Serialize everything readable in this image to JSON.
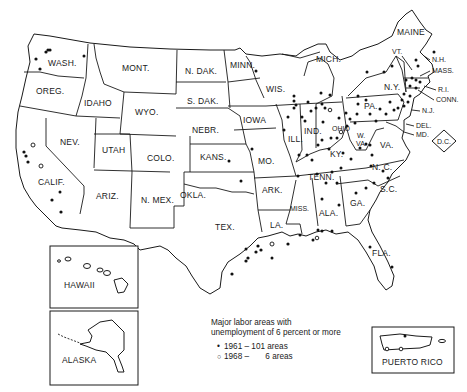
{
  "map": {
    "title": "Major labor areas with unemployment of 6 percent or more",
    "states": [
      {
        "id": "wa",
        "label": "WASH.",
        "x": 48,
        "y": 64
      },
      {
        "id": "or",
        "label": "OREG.",
        "x": 37,
        "y": 92
      },
      {
        "id": "id",
        "label": "IDAHO",
        "x": 84,
        "y": 104
      },
      {
        "id": "mt",
        "label": "MONT.",
        "x": 122,
        "y": 69
      },
      {
        "id": "wy",
        "label": "WYO.",
        "x": 136,
        "y": 113
      },
      {
        "id": "nd",
        "label": "N. DAK.",
        "x": 185,
        "y": 72
      },
      {
        "id": "sd",
        "label": "S. DAK.",
        "x": 187,
        "y": 102
      },
      {
        "id": "ne",
        "label": "NEBR.",
        "x": 192,
        "y": 131
      },
      {
        "id": "mn",
        "label": "MINN.",
        "x": 232,
        "y": 66
      },
      {
        "id": "ia",
        "label": "IOWA",
        "x": 244,
        "y": 121
      },
      {
        "id": "wi",
        "label": "WIS.",
        "x": 265,
        "y": 92
      },
      {
        "id": "mi",
        "label": "MICH.",
        "x": 318,
        "y": 62
      },
      {
        "id": "nv",
        "label": "NEV.",
        "x": 61,
        "y": 143
      },
      {
        "id": "ut",
        "label": "UTAH",
        "x": 103,
        "y": 151
      },
      {
        "id": "co",
        "label": "COLO.",
        "x": 147,
        "y": 159
      },
      {
        "id": "ks",
        "label": "KANS.",
        "x": 201,
        "y": 158
      },
      {
        "id": "mo",
        "label": "MO.",
        "x": 259,
        "y": 162
      },
      {
        "id": "il",
        "label": "ILL.",
        "x": 291,
        "y": 140
      },
      {
        "id": "in",
        "label": "IND.",
        "x": 316,
        "y": 132
      },
      {
        "id": "oh",
        "label": "OHIO",
        "x": 336,
        "y": 130
      },
      {
        "id": "ky",
        "label": "KY.",
        "x": 333,
        "y": 155
      },
      {
        "id": "wv",
        "label": "W.\nVA.",
        "x": 360,
        "y": 140
      },
      {
        "id": "va",
        "label": "VA.",
        "x": 382,
        "y": 146
      },
      {
        "id": "pa",
        "label": "PA.",
        "x": 366,
        "y": 107
      },
      {
        "id": "ny",
        "label": "N.Y.",
        "x": 384,
        "y": 88
      },
      {
        "id": "ca",
        "label": "CALIF.",
        "x": 38,
        "y": 183
      },
      {
        "id": "az",
        "label": "ARIZ.",
        "x": 96,
        "y": 197
      },
      {
        "id": "nm",
        "label": "N. MEX.",
        "x": 143,
        "y": 201
      },
      {
        "id": "ok",
        "label": "OKLA.",
        "x": 181,
        "y": 195
      },
      {
        "id": "ar",
        "label": "ARK.",
        "x": 259,
        "y": 193
      },
      {
        "id": "tn",
        "label": "TENN.",
        "x": 309,
        "y": 178
      },
      {
        "id": "nc",
        "label": "N. C.",
        "x": 374,
        "y": 168
      },
      {
        "id": "sc",
        "label": "S.C.",
        "x": 381,
        "y": 190
      },
      {
        "id": "ga",
        "label": "GA.",
        "x": 352,
        "y": 204
      },
      {
        "id": "al",
        "label": "ALA.",
        "x": 321,
        "y": 214
      },
      {
        "id": "ms",
        "label": "MISS.",
        "x": 291,
        "y": 209
      },
      {
        "id": "la",
        "label": "LA.",
        "x": 274,
        "y": 226
      },
      {
        "id": "tx",
        "label": "TEX.",
        "x": 218,
        "y": 228
      },
      {
        "id": "fl",
        "label": "FLA.",
        "x": 381,
        "y": 254
      }
    ],
    "ne_callouts": [
      {
        "label": "MAINE",
        "x": 394,
        "y": 35
      },
      {
        "label": "VT.",
        "x": 393,
        "y": 52
      },
      {
        "label": "N.H.",
        "x": 433,
        "y": 62
      },
      {
        "label": "MASS.",
        "x": 433,
        "y": 72
      },
      {
        "label": "R.I.",
        "x": 438,
        "y": 92
      },
      {
        "label": "CONN.",
        "x": 435,
        "y": 103
      },
      {
        "label": "N.J.",
        "x": 423,
        "y": 113
      },
      {
        "label": "DEL.",
        "x": 418,
        "y": 128
      },
      {
        "label": "MD.",
        "x": 418,
        "y": 138
      },
      {
        "label": "D.C.",
        "x": 440,
        "y": 141
      }
    ],
    "insets": [
      {
        "id": "hawaii",
        "label": "HAWAII"
      },
      {
        "id": "alaska",
        "label": "ALASKA"
      },
      {
        "id": "puerto_rico",
        "label": "PUERTO RICO"
      }
    ]
  },
  "legend": {
    "heading_line1": "Major labor areas with",
    "heading_line2": "unemployment of 6 percent or more",
    "items": [
      {
        "marker": "filled-dot",
        "year": "1961",
        "separator": "–",
        "count": "101 areas"
      },
      {
        "marker": "open-circle",
        "year": "1968",
        "separator": "–",
        "count": "6 areas"
      }
    ]
  },
  "colors": {
    "ink": "#1a1a1a",
    "paper": "#ffffff"
  }
}
